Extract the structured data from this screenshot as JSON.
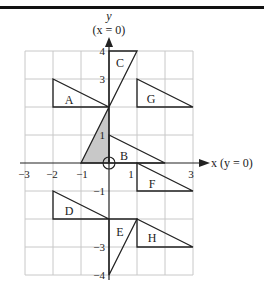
{
  "axes": {
    "y_label": "y",
    "y_sublabel": "(x = 0)",
    "x_label": "x  (y = 0)",
    "x_ticks": [
      {
        "value": -3,
        "label": "−3"
      },
      {
        "value": -2,
        "label": "−2"
      },
      {
        "value": -1,
        "label": "−1"
      },
      {
        "value": 1,
        "label": "1"
      },
      {
        "value": 3,
        "label": "3"
      }
    ],
    "y_ticks": [
      {
        "value": 4,
        "label": "4"
      },
      {
        "value": 3,
        "label": "3"
      },
      {
        "value": 1,
        "label": "1"
      },
      {
        "value": -1,
        "label": "−1"
      },
      {
        "value": -3,
        "label": "−3"
      },
      {
        "value": -4,
        "label": "−4"
      }
    ],
    "x_range": [
      -3,
      3
    ],
    "y_range": [
      -4,
      4
    ]
  },
  "shapes": {
    "shaded": {
      "label": "",
      "vertices": [
        [
          -1,
          0
        ],
        [
          0,
          0
        ],
        [
          0,
          2
        ]
      ],
      "fill": "#c8c8c8"
    },
    "A": {
      "label": "A",
      "vertices": [
        [
          -2,
          3
        ],
        [
          -2,
          2
        ],
        [
          0,
          2
        ]
      ]
    },
    "B": {
      "label": "B",
      "vertices": [
        [
          0,
          1
        ],
        [
          0,
          0
        ],
        [
          2,
          0
        ]
      ]
    },
    "C": {
      "label": "C",
      "vertices": [
        [
          0,
          4
        ],
        [
          1,
          4
        ],
        [
          0,
          2
        ]
      ]
    },
    "D": {
      "label": "D",
      "vertices": [
        [
          -2,
          -1
        ],
        [
          -2,
          -2
        ],
        [
          0,
          -2
        ]
      ]
    },
    "E": {
      "label": "E",
      "vertices": [
        [
          0,
          -2
        ],
        [
          1,
          -2
        ],
        [
          0,
          -4
        ]
      ]
    },
    "F": {
      "label": "F",
      "vertices": [
        [
          1,
          0
        ],
        [
          1,
          -1
        ],
        [
          3,
          -1
        ]
      ]
    },
    "G": {
      "label": "G",
      "vertices": [
        [
          1,
          3
        ],
        [
          1,
          2
        ],
        [
          3,
          2
        ]
      ]
    },
    "H": {
      "label": "H",
      "vertices": [
        [
          1,
          -2
        ],
        [
          1,
          -3
        ],
        [
          3,
          -3
        ]
      ]
    }
  },
  "origin_marker": "circle",
  "colors": {
    "grid": "#c8c8c8",
    "stroke": "#222222",
    "shade": "#c8c8c8"
  }
}
